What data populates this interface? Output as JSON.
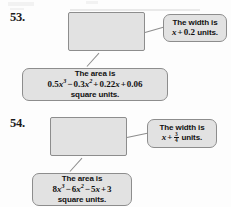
{
  "page": {
    "background_color": "#fdfdfd",
    "shape_fill_color": "#e2e2e2",
    "shape_border_color": "#8d8d8d",
    "text_color": "#111111"
  },
  "problems": [
    {
      "number": "53.",
      "shape": "rectangle",
      "width_callout": {
        "line1": "The width is",
        "line2_prefix": "x",
        "line2_operator": "+",
        "line2_value": "0.2",
        "line2_suffix": "units.",
        "has_fraction": false
      },
      "area_callout": {
        "line1": "The area is",
        "expression": "0.5x³ − 0.3x² + 0.22x + 0.06",
        "terms": [
          {
            "coef": "0.5",
            "var": "x",
            "exp": "3",
            "op": ""
          },
          {
            "coef": "0.3",
            "var": "x",
            "exp": "2",
            "op": "−"
          },
          {
            "coef": "0.22",
            "var": "x",
            "exp": "",
            "op": "+"
          },
          {
            "coef": "0.06",
            "var": "",
            "exp": "",
            "op": "+"
          }
        ],
        "line3": "square units."
      }
    },
    {
      "number": "54.",
      "shape": "rectangle",
      "width_callout": {
        "line1": "The width is",
        "line2_prefix": "x",
        "line2_operator": "+",
        "line2_value": "3/4",
        "fraction_numerator": "3",
        "fraction_denominator": "4",
        "line2_suffix": "units.",
        "has_fraction": true
      },
      "area_callout": {
        "line1": "The area is",
        "expression": "8x³ − 6x² − 5x + 3",
        "terms": [
          {
            "coef": "8",
            "var": "x",
            "exp": "3",
            "op": ""
          },
          {
            "coef": "6",
            "var": "x",
            "exp": "2",
            "op": "−"
          },
          {
            "coef": "5",
            "var": "x",
            "exp": "",
            "op": "−"
          },
          {
            "coef": "3",
            "var": "",
            "exp": "",
            "op": "+"
          }
        ],
        "line3": "square units."
      }
    }
  ]
}
